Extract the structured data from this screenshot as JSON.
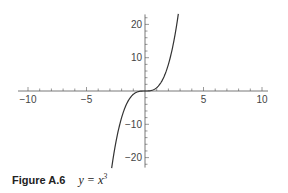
{
  "caption": {
    "figure_label": "Figure A.6",
    "equation_lhs": "y = x",
    "equation_exponent": "3"
  },
  "chart_data": {
    "type": "line",
    "xlabel": "",
    "ylabel": "",
    "xlim": [
      -10,
      10
    ],
    "ylim": [
      -23,
      23
    ],
    "x_ticks": [
      -10,
      -5,
      5,
      10
    ],
    "y_ticks": [
      -20,
      -10,
      10,
      20
    ],
    "x_tick_labels": [
      "−10",
      "−5",
      "5",
      "10"
    ],
    "y_tick_labels": [
      "−20",
      "−10",
      "10",
      "20"
    ],
    "x_minor_step": 1,
    "y_minor_step": 2,
    "grid": false,
    "legend": null,
    "series": [
      {
        "name": "y = x^3",
        "x": [
          -2.85,
          -2.5,
          -2,
          -1.5,
          -1,
          -0.5,
          0,
          0.5,
          1,
          1.5,
          2,
          2.5,
          2.85
        ],
        "y": [
          -23.15,
          -15.63,
          -8,
          -3.38,
          -1,
          -0.13,
          0,
          0.13,
          1,
          3.38,
          8,
          15.63,
          23.15
        ],
        "color": "#333333"
      }
    ]
  }
}
